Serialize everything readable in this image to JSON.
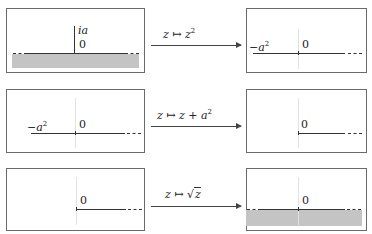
{
  "rows": [
    {
      "map_label_prefix": "z ↦ z",
      "map_label_sup": "2",
      "left": {
        "label_top": "ia",
        "label_origin": "0",
        "shaded": "lower-half-plane",
        "cut": "vertical segment from 0 to ia"
      },
      "right": {
        "label_left": "−a",
        "label_left_sup": "2",
        "label_origin": "0",
        "shaded": "none",
        "cut": "ray from -a^2 to +∞"
      }
    },
    {
      "map_label_prefix": "z ↦ z + a",
      "map_label_sup": "2",
      "left": {
        "label_left": "−a",
        "label_left_sup": "2",
        "label_origin": "0",
        "shaded": "none"
      },
      "right": {
        "label_origin": "0",
        "shaded": "none",
        "cut": "ray from 0 to +∞"
      }
    },
    {
      "map_label_prefix": "z ↦ ",
      "map_label_sqrt": "z",
      "left": {
        "label_origin": "0",
        "shaded": "none",
        "cut": "ray from 0 to +∞"
      },
      "right": {
        "label_origin": "0",
        "shaded": "lower-half-plane"
      }
    }
  ],
  "colors": {
    "border": "#6a6a6a",
    "shade": "#c4c4c4",
    "line": "#333333",
    "guide": "#e2e2e2"
  }
}
